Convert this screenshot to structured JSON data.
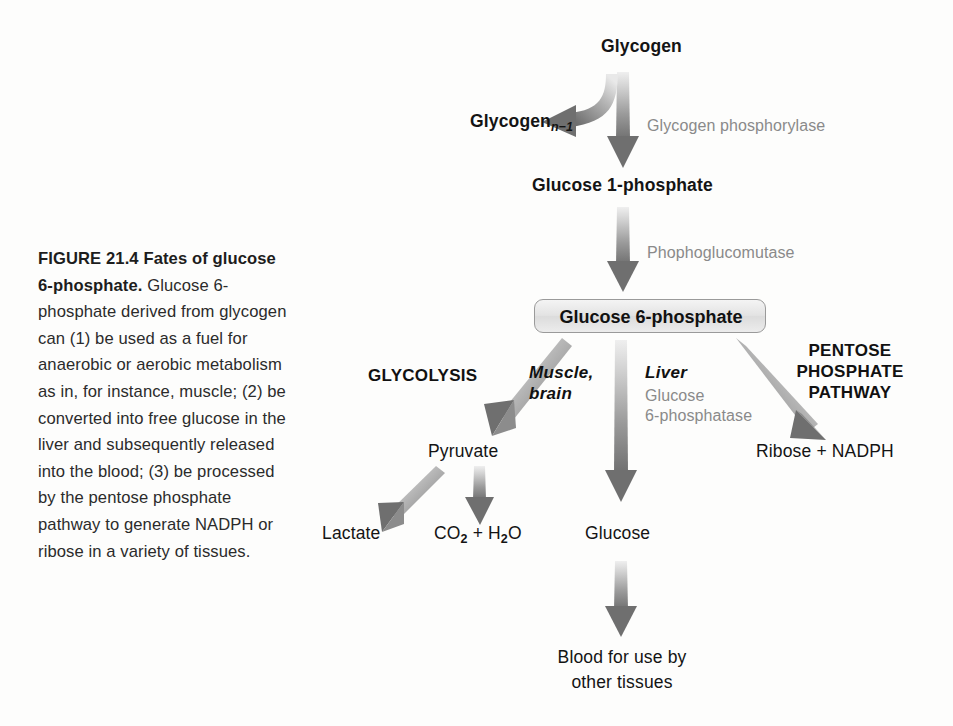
{
  "figure": {
    "caption_lead": "FIGURE 21.4  Fates of glucose 6-phosphate.",
    "caption_body": "Glucose 6-phosphate derived from glycogen can (1) be used as a fuel for anaerobic or aerobic metabolism as in, for instance, muscle; (2) be converted into free glucose in the liver and subsequently released into the blood; (3) be processed by the pentose phosphate pathway to generate NADPH or ribose in a variety of tissues."
  },
  "diagram": {
    "nodes": {
      "glycogen": "Glycogen",
      "glycogen_n1_base": "Glycogen",
      "glycogen_n1_sub": "n−1",
      "glucose_1_phosphate": "Glucose 1-phosphate",
      "glucose_6_phosphate": "Glucose 6-phosphate",
      "pyruvate": "Pyruvate",
      "lactate": "Lactate",
      "co2_h2o_c": "CO",
      "co2_h2o_sub1": "2",
      "co2_h2o_mid": " + H",
      "co2_h2o_sub2": "2",
      "co2_h2o_end": "O",
      "glucose": "Glucose",
      "blood_line1": "Blood for use by",
      "blood_line2": "other tissues",
      "ribose_nadph": "Ribose + NADPH"
    },
    "enzymes": {
      "glycogen_phosphorylase": "Glycogen phosphorylase",
      "phosphoglucomutase": "Phophoglucomutase",
      "glucose_6_phosphatase_line1": "Glucose",
      "glucose_6_phosphatase_line2": "6-phosphatase"
    },
    "pathways": {
      "glycolysis": "GLYCOLYSIS",
      "muscle_brain_line1": "Muscle,",
      "muscle_brain_line2": "brain",
      "liver": "Liver",
      "pentose_line1": "PENTOSE",
      "pentose_line2": "PHOSPHATE",
      "pentose_line3": "PATHWAY"
    },
    "colors": {
      "background": "#fdfdfc",
      "text": "#141414",
      "enzyme_text": "#8a8a8a",
      "arrow_dark": "#787878",
      "arrow_light": "#e8e8e8",
      "box_border": "#9a9a9a",
      "box_fill": "#e6e6e6"
    }
  }
}
